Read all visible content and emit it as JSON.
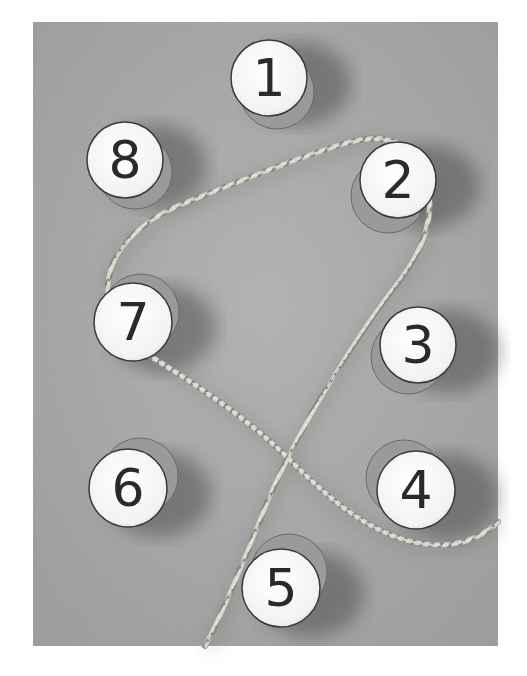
{
  "photo": {
    "frame": {
      "x": 33,
      "y": 22,
      "width": 465,
      "height": 624
    },
    "background_color": "#a9a9a9",
    "description": "Grayscale photo of eight numbered disks arranged in a circle with a rope weaving between them"
  },
  "disks": [
    {
      "label": "1",
      "cx": 269,
      "cy": 78,
      "r": 38,
      "side_dx": 8,
      "side_dy": 14
    },
    {
      "label": "2",
      "cx": 398,
      "cy": 180,
      "r": 38,
      "side_dx": -10,
      "side_dy": 16
    },
    {
      "label": "3",
      "cx": 418,
      "cy": 345,
      "r": 38,
      "side_dx": -10,
      "side_dy": 12
    },
    {
      "label": "4",
      "cx": 416,
      "cy": 490,
      "r": 39,
      "side_dx": -12,
      "side_dy": -12
    },
    {
      "label": "5",
      "cx": 281,
      "cy": 588,
      "r": 39,
      "side_dx": 8,
      "side_dy": -16
    },
    {
      "label": "6",
      "cx": 128,
      "cy": 488,
      "r": 39,
      "side_dx": 12,
      "side_dy": -12
    },
    {
      "label": "7",
      "cx": 133,
      "cy": 322,
      "r": 39,
      "side_dx": 8,
      "side_dy": -10
    },
    {
      "label": "8",
      "cx": 125,
      "cy": 160,
      "r": 38,
      "side_dx": 10,
      "side_dy": 12
    }
  ],
  "rope": {
    "color": "#d8d4cc",
    "shadow_color": "#6e6e6e",
    "path": "M 205 646 C 240 580, 265 500, 282 470 C 305 420, 360 330, 400 280 C 430 240, 440 200, 418 160 C 400 135, 370 135, 340 145 C 290 160, 230 185, 180 205 C 140 222, 110 250, 108 285 C 106 310, 110 335, 140 350 C 190 380, 250 420, 290 460 C 330 500, 380 545, 440 545 C 470 545, 490 530, 498 522"
  }
}
